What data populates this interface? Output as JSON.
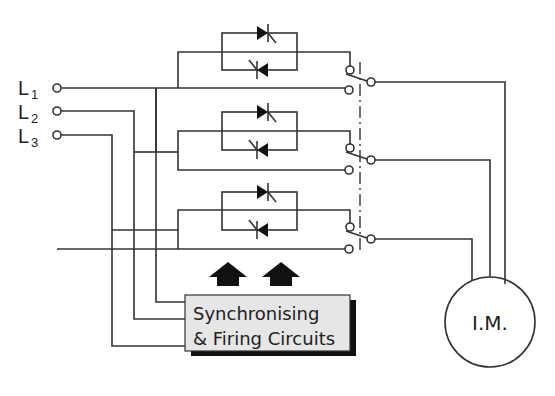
{
  "diagram": {
    "type": "soft-starter circuit",
    "lines": [
      {
        "label": "L",
        "sub": "1"
      },
      {
        "label": "L",
        "sub": "2"
      },
      {
        "label": "L",
        "sub": "3"
      }
    ],
    "thyristor_pairs": 3,
    "controller": {
      "line1": "Synchronising",
      "line2": "& Firing Circuits"
    },
    "motor": {
      "label": "I.M."
    },
    "colors": {
      "wire": "#333333",
      "box_fill": "#e6e6e6",
      "box_shadow": "#111111",
      "arrow": "#111111"
    }
  }
}
